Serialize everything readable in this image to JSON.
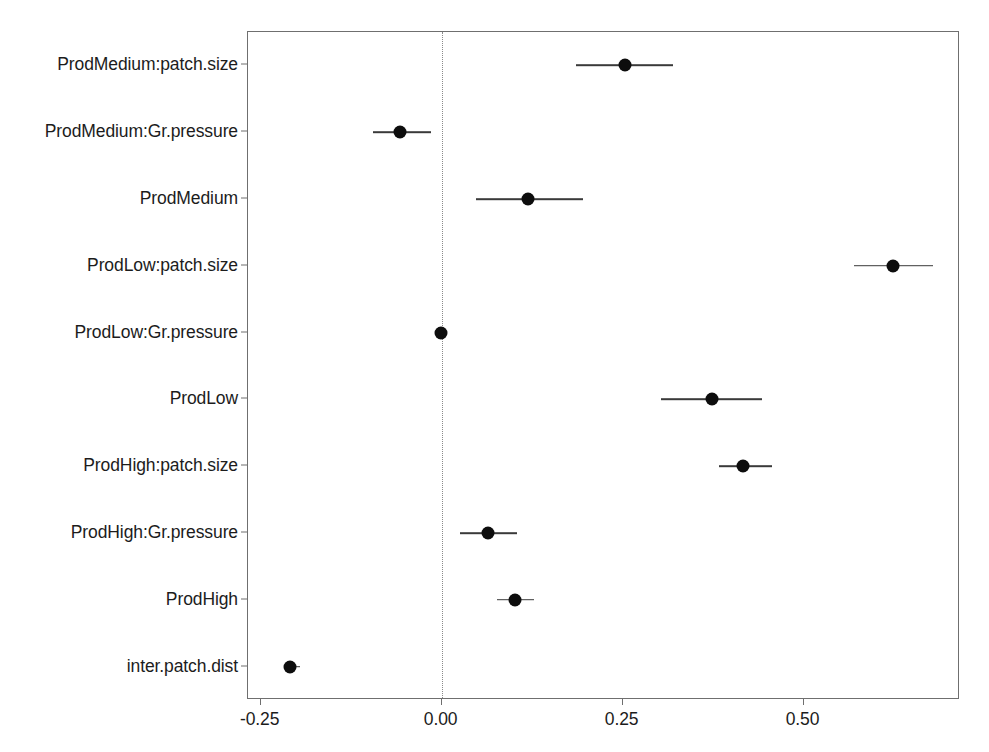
{
  "chart_data": {
    "type": "scatter",
    "subtype": "coefficient-forest-plot",
    "title": "",
    "xlabel": "",
    "ylabel": "",
    "xlim": [
      -0.2675,
      0.7161
    ],
    "xticks": [
      -0.25,
      0.0,
      0.25,
      0.5
    ],
    "xticklabels": [
      "-0.25",
      "0.00",
      "0.25",
      "0.50"
    ],
    "grid": false,
    "legend": null,
    "reference_line": {
      "x": 0.0,
      "style": "dotted",
      "color": "#8a8a8a"
    },
    "point_color": "#0d0d0d",
    "error_bar_color": "#3a3a3a",
    "categories": [
      "ProdMedium:patch.size",
      "ProdMedium:Gr.pressure",
      "ProdMedium",
      "ProdLow:patch.size",
      "ProdLow:Gr.pressure",
      "ProdLow",
      "ProdHigh:patch.size",
      "ProdHigh:Gr.pressure",
      "ProdHigh",
      "inter.patch.dist"
    ],
    "points": [
      {
        "label": "ProdMedium:patch.size",
        "estimate": 0.253,
        "ci_low": 0.185,
        "ci_high": 0.319
      },
      {
        "label": "ProdMedium:Gr.pressure",
        "estimate": -0.057,
        "ci_low": -0.095,
        "ci_high": -0.015
      },
      {
        "label": "ProdMedium",
        "estimate": 0.119,
        "ci_low": 0.047,
        "ci_high": 0.195
      },
      {
        "label": "ProdLow:patch.size",
        "estimate": 0.624,
        "ci_low": 0.569,
        "ci_high": 0.679
      },
      {
        "label": "ProdLow:Gr.pressure",
        "estimate": -0.001,
        "ci_low": -0.006,
        "ci_high": 0.005
      },
      {
        "label": "ProdLow",
        "estimate": 0.373,
        "ci_low": 0.303,
        "ci_high": 0.442
      },
      {
        "label": "ProdHigh:patch.size",
        "estimate": 0.417,
        "ci_low": 0.383,
        "ci_high": 0.457
      },
      {
        "label": "ProdHigh:Gr.pressure",
        "estimate": 0.064,
        "ci_low": 0.026,
        "ci_high": 0.104
      },
      {
        "label": "ProdHigh",
        "estimate": 0.102,
        "ci_low": 0.077,
        "ci_high": 0.127
      },
      {
        "label": "inter.patch.dist",
        "estimate": -0.209,
        "ci_low": -0.218,
        "ci_high": -0.195
      }
    ]
  }
}
